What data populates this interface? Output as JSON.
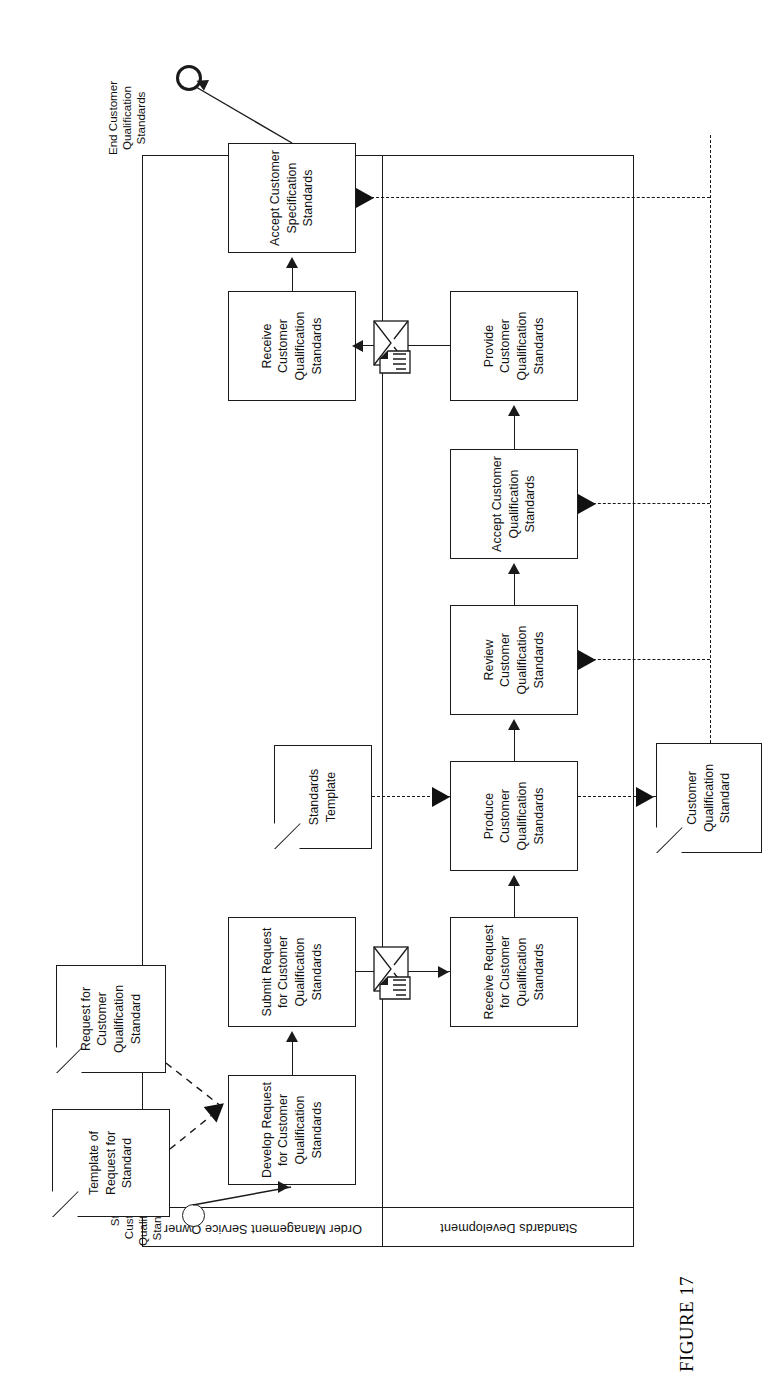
{
  "figure": {
    "caption": "FIGURE 17"
  },
  "diagram": {
    "type": "bpmn-process-diagram",
    "orientation": "rotated-90-ccw",
    "pool": {
      "lanes": [
        {
          "id": "lane-order-management",
          "label": "Order Management Service Owner"
        },
        {
          "id": "lane-standards-development",
          "label": "Standards Development"
        }
      ]
    },
    "events": [
      {
        "id": "start-event",
        "kind": "start",
        "label": "Start Customer Qualification Standards"
      },
      {
        "id": "end-event",
        "kind": "end",
        "label": "End Customer Qualification Standards"
      }
    ],
    "tasks": [
      {
        "id": "task-develop-request",
        "lane": "lane-order-management",
        "label": "Develop Request for Customer Qualification Standards"
      },
      {
        "id": "task-submit-request",
        "lane": "lane-order-management",
        "label": "Submit Request for Customer Qualification Standards"
      },
      {
        "id": "task-receive-customer-qualification-standards",
        "lane": "lane-order-management",
        "label": "Receive Customer Qualification Standards"
      },
      {
        "id": "task-accept-customer-specification-standards",
        "lane": "lane-order-management",
        "label": "Accept Customer Specification Standards"
      },
      {
        "id": "task-receive-request",
        "lane": "lane-standards-development",
        "label": "Receive Request for Customer Qualification Standards"
      },
      {
        "id": "task-produce",
        "lane": "lane-standards-development",
        "label": "Produce Customer Qualification Standards"
      },
      {
        "id": "task-review",
        "lane": "lane-standards-development",
        "label": "Review  Customer Qualification Standards"
      },
      {
        "id": "task-accept-qualification",
        "lane": "lane-standards-development",
        "label": "Accept Customer Qualification Standards"
      },
      {
        "id": "task-provide",
        "lane": "lane-standards-development",
        "label": "Provide Customer Qualification Standards"
      }
    ],
    "data_objects": [
      {
        "id": "doc-template-of-request",
        "label": "Template of Request for Standard"
      },
      {
        "id": "doc-request-for-customer-qualification-standard",
        "label": "Request for Customer Qualification Standard"
      },
      {
        "id": "doc-standards-template",
        "label": "Standards Template"
      },
      {
        "id": "doc-customer-qualification-standard",
        "label": "Customer Qualification Standard"
      }
    ],
    "message_flows": [
      {
        "id": "message-request",
        "icon": "envelope-document-icon",
        "from": "task-submit-request",
        "to": "task-receive-request"
      },
      {
        "id": "message-standards",
        "icon": "envelope-document-icon",
        "from": "task-provide",
        "to": "task-receive-customer-qualification-standards"
      }
    ]
  },
  "colors": {
    "line": "#1a1a1a",
    "fill": "#ffffff",
    "text": "#111111"
  }
}
